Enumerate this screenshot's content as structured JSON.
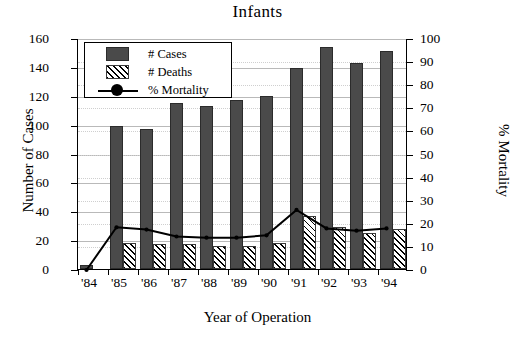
{
  "chart_data": {
    "type": "bar",
    "title": "Infants",
    "xlabel": "Year of Operation",
    "ylabel": "Number of Cases",
    "y2label": "% Mortality",
    "categories": [
      "'84",
      "'85",
      "'86",
      "'87",
      "'88",
      "'89",
      "'90",
      "'91",
      "'92",
      "'93",
      "'94"
    ],
    "ylim": [
      0,
      160
    ],
    "y2lim": [
      0,
      100
    ],
    "yticks": [
      0,
      20,
      40,
      60,
      80,
      100,
      120,
      140,
      160
    ],
    "y2ticks": [
      0,
      10,
      20,
      30,
      40,
      50,
      60,
      70,
      80,
      90,
      100
    ],
    "grid": true,
    "legend_position": "top-left",
    "series": [
      {
        "name": "# Cases",
        "axis": "left",
        "type": "bar",
        "values": [
          3,
          99,
          97,
          115,
          113,
          117,
          120,
          139,
          154,
          143,
          151
        ]
      },
      {
        "name": "# Deaths",
        "axis": "left",
        "type": "bar",
        "values": [
          0,
          18,
          17,
          17,
          16,
          16,
          18,
          37,
          29,
          25,
          28
        ]
      },
      {
        "name": "% Mortality",
        "axis": "right",
        "type": "line",
        "values": [
          0,
          18.5,
          17.5,
          14.5,
          14,
          14,
          15,
          26,
          18,
          17,
          18
        ]
      }
    ]
  },
  "legend": {
    "items": [
      {
        "label": "# Cases",
        "swatch": "dark-bar-swatch"
      },
      {
        "label": "# Deaths",
        "swatch": "hatched-bar-swatch"
      },
      {
        "label": "% Mortality",
        "swatch": "line-marker-swatch"
      }
    ]
  },
  "colors": {
    "cases_fill": "#4a4a4a",
    "deaths_fill": "#ffffff",
    "line": "#000000",
    "grid": "#b9b9b9",
    "axis": "#000000",
    "background": "#ffffff"
  }
}
